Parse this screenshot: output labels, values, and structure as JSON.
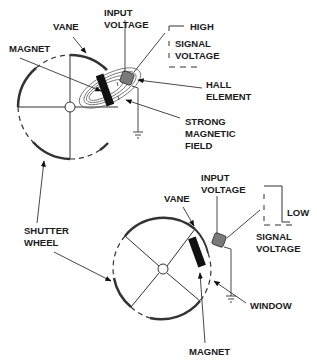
{
  "colors": {
    "line": "#333333",
    "text": "#1a1a1a",
    "magnet": "#111111",
    "hall_element": "#7a7a7a",
    "background": "#ffffff"
  },
  "top": {
    "labels": {
      "vane": "VANE",
      "input_voltage_1": "INPUT",
      "input_voltage_2": "VOLTAGE",
      "magnet": "MAGNET",
      "high": "HIGH",
      "signal_1": "SIGNAL",
      "signal_2": "VOLTAGE",
      "hall_1": "HALL",
      "hall_2": "ELEMENT",
      "field_1": "STRONG",
      "field_2": "MAGNETIC",
      "field_3": "FIELD"
    }
  },
  "shared": {
    "shutter_1": "SHUTTER",
    "shutter_2": "WHEEL"
  },
  "bottom": {
    "labels": {
      "input_voltage_1": "INPUT",
      "input_voltage_2": "VOLTAGE",
      "vane": "VANE",
      "low": "LOW",
      "signal_1": "SIGNAL",
      "signal_2": "VOLTAGE",
      "window": "WINDOW",
      "magnet": "MAGNET"
    }
  }
}
